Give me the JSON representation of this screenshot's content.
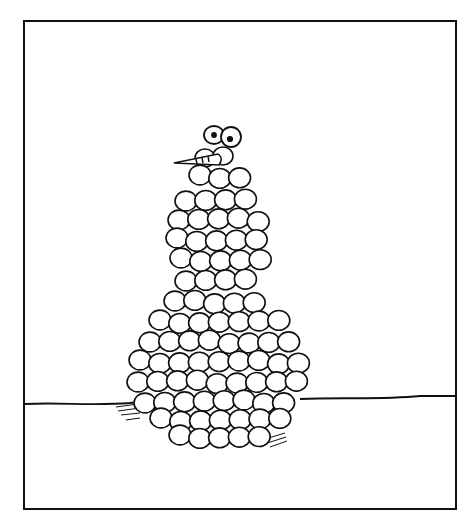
{
  "illustration": {
    "subject": "Cartoon snowman made of many small snowballs",
    "colors": {
      "ink": "#111111",
      "paper": "#ffffff"
    },
    "frame": {
      "x": 24,
      "y": 21,
      "width": 432,
      "height": 488
    }
  }
}
